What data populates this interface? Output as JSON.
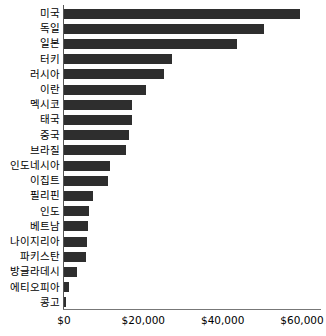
{
  "chart_data": {
    "type": "bar",
    "orientation": "horizontal",
    "title": "",
    "subtitle": "",
    "xlabel": "",
    "ylabel": "",
    "xlim": [
      0,
      60000
    ],
    "grid": false,
    "legend": null,
    "legend_position": "none",
    "bar_color": "#2e2e2e",
    "axis_color": "#777777",
    "tick_labels": [
      "$0",
      "$20,000",
      "$40,000",
      "$60,000"
    ],
    "tick_values": [
      0,
      20000,
      40000,
      60000
    ],
    "categories": [
      "미국",
      "독일",
      "일본",
      "터키",
      "러시아",
      "이란",
      "멕시코",
      "태국",
      "중국",
      "브라질",
      "인도네시아",
      "이집트",
      "필리핀",
      "인도",
      "베트남",
      "나이지리아",
      "파키스탄",
      "방글라데시",
      "에티오피아",
      "콩고"
    ],
    "values": [
      59500,
      50400,
      43600,
      27200,
      25200,
      20700,
      17100,
      17100,
      16400,
      15600,
      11600,
      11100,
      7300,
      6300,
      6000,
      5800,
      5500,
      3300,
      1250,
      200
    ]
  }
}
